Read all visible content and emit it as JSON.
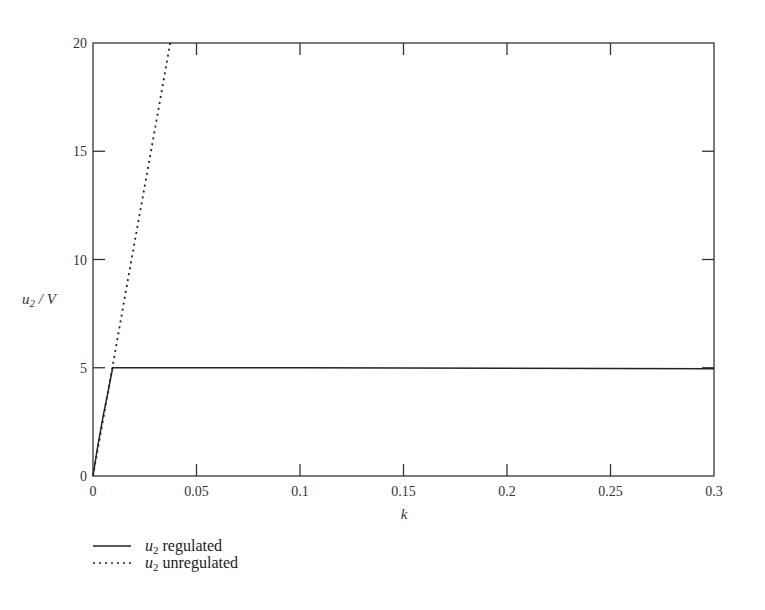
{
  "chart_data": {
    "type": "line",
    "title": "",
    "xlabel": "k",
    "ylabel": "u2 / V",
    "xlim": [
      0,
      0.3
    ],
    "ylim": [
      0,
      20
    ],
    "grid": false,
    "x_ticks": [
      0,
      0.05,
      0.1,
      0.15,
      0.2,
      0.25,
      0.3
    ],
    "x_tick_labels": [
      "0",
      "0.05",
      "0.1",
      "0.15",
      "0.2",
      "0.25",
      "0.3"
    ],
    "y_ticks": [
      0,
      5,
      10,
      15,
      20
    ],
    "y_tick_labels": [
      "0",
      "5",
      "10",
      "15",
      "20"
    ],
    "legend_position": "below-left",
    "series": [
      {
        "name": "u2 regulated",
        "style": "solid",
        "x": [
          0,
          0.002,
          0.005,
          0.0075,
          0.0095,
          0.05,
          0.1,
          0.15,
          0.2,
          0.25,
          0.3
        ],
        "y": [
          0,
          1.2,
          2.8,
          4.0,
          5.0,
          5.0,
          5.0,
          4.99,
          4.98,
          4.97,
          4.95
        ]
      },
      {
        "name": "u2 unregulated",
        "style": "dotted",
        "x": [
          0,
          0.0093,
          0.0186,
          0.028,
          0.0373
        ],
        "y": [
          0,
          5,
          10,
          15,
          20
        ]
      }
    ]
  },
  "legend": {
    "items": [
      {
        "symbol": "u",
        "subscript": "2",
        "label": " regulated",
        "style": "solid"
      },
      {
        "symbol": "u",
        "subscript": "2",
        "label": " unregulated",
        "style": "dotted"
      }
    ]
  },
  "axes": {
    "ylabel_symbol": "u",
    "ylabel_subscript": "2",
    "ylabel_rest": " / V",
    "xlabel": "k"
  }
}
